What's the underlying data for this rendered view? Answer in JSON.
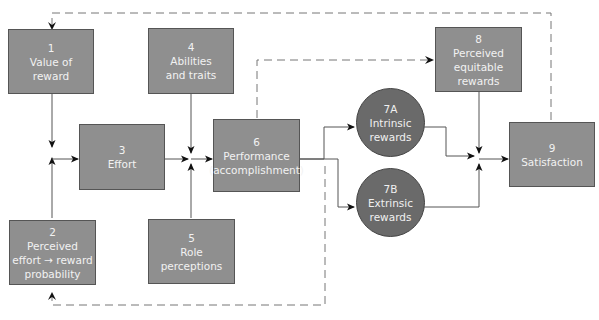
{
  "diagram": {
    "type": "flow-model",
    "colors": {
      "box_fill": "#8f8f8f",
      "circle_fill": "#6a6a6a",
      "text": "#f2f2f2",
      "line": "#555555",
      "dashed": "#777777"
    },
    "nodes": {
      "n1": {
        "num": "1",
        "lines": [
          "Value of",
          "reward"
        ]
      },
      "n2": {
        "num": "2",
        "lines": [
          "Perceived",
          "effort → reward",
          "probability"
        ]
      },
      "n3": {
        "num": "3",
        "lines": [
          "Effort"
        ]
      },
      "n4": {
        "num": "4",
        "lines": [
          "Abilities",
          "and traits"
        ]
      },
      "n5": {
        "num": "5",
        "lines": [
          "Role",
          "perceptions"
        ]
      },
      "n6": {
        "num": "6",
        "lines": [
          "Performance",
          "(accomplishment)"
        ]
      },
      "n7a": {
        "num": "7A",
        "lines": [
          "Intrinsic",
          "rewards"
        ]
      },
      "n7b": {
        "num": "7B",
        "lines": [
          "Extrinsic",
          "rewards"
        ]
      },
      "n8": {
        "num": "8",
        "lines": [
          "Perceived",
          "equitable",
          "rewards"
        ]
      },
      "n9": {
        "num": "9",
        "lines": [
          "Satisfaction"
        ]
      }
    },
    "edges": [
      {
        "from": "1",
        "to": "3",
        "style": "solid"
      },
      {
        "from": "2",
        "to": "3",
        "style": "solid"
      },
      {
        "from": "3",
        "to": "6",
        "style": "solid"
      },
      {
        "from": "4",
        "to": "6",
        "style": "solid"
      },
      {
        "from": "5",
        "to": "6",
        "style": "solid"
      },
      {
        "from": "6",
        "to": "7A",
        "style": "solid"
      },
      {
        "from": "6",
        "to": "7B",
        "style": "solid"
      },
      {
        "from": "6",
        "to": "8",
        "style": "dashed"
      },
      {
        "from": "6",
        "to": "2",
        "style": "dashed"
      },
      {
        "from": "7A",
        "to": "9",
        "style": "solid"
      },
      {
        "from": "7B",
        "to": "9",
        "style": "solid"
      },
      {
        "from": "8",
        "to": "9",
        "style": "solid"
      },
      {
        "from": "9",
        "to": "1",
        "style": "dashed"
      }
    ]
  }
}
